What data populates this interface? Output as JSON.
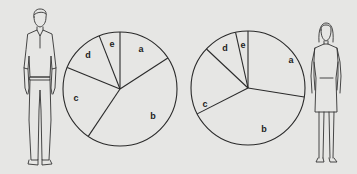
{
  "figures": {
    "left": {
      "label": "man-figure"
    },
    "right": {
      "label": "woman-figure"
    }
  },
  "chart_data": [
    {
      "type": "pie",
      "title": "",
      "associated_figure": "man",
      "categories": [
        "a",
        "b",
        "c",
        "d",
        "e"
      ],
      "values": [
        16,
        44,
        22,
        13,
        6
      ],
      "start_angle_deg": 0,
      "direction": "clockwise",
      "center": [
        120,
        89
      ],
      "radius": 57,
      "label_positions": [
        [
          141,
          50
        ],
        [
          153,
          117
        ],
        [
          76,
          99
        ],
        [
          88,
          56
        ],
        [
          112,
          45
        ]
      ]
    },
    {
      "type": "pie",
      "title": "",
      "associated_figure": "woman",
      "categories": [
        "a",
        "b",
        "c",
        "d",
        "e"
      ],
      "values": [
        27.5,
        40,
        19.5,
        9.5,
        3.5
      ],
      "start_angle_deg": 0,
      "direction": "clockwise",
      "center": [
        248,
        88
      ],
      "radius": 57,
      "label_positions": [
        [
          291,
          61
        ],
        [
          264,
          130
        ],
        [
          205,
          105
        ],
        [
          225,
          49
        ],
        [
          243,
          46
        ]
      ]
    }
  ],
  "colors": {
    "background": "#e6e6e4",
    "ink": "#2a2a2a"
  }
}
